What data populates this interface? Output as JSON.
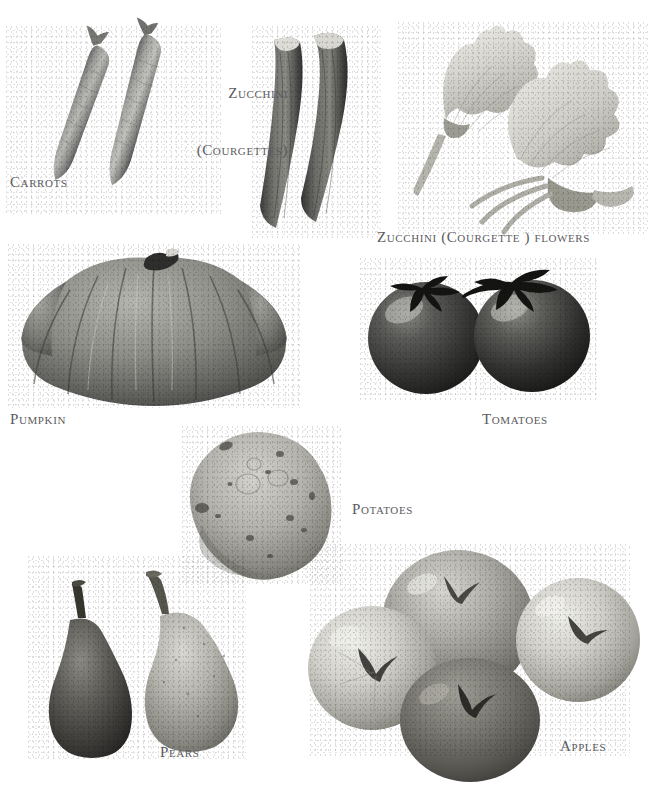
{
  "page": {
    "background_color": "#ffffff",
    "caption_color": "#5b5b60",
    "style": "black-and-white photographic plate of vegetables and fruits with small-caps serif captions"
  },
  "captions": {
    "carrots": "Carrots",
    "zucchini_line1": "Zucchini",
    "zucchini_line2": "(Courgettes)",
    "zucchini_flowers": "Zucchini (Courgette ) flowers",
    "pumpkin": "Pumpkin",
    "tomatoes": "Tomatoes",
    "potatoes": "Potatoes",
    "pears": "Pears",
    "apples": "Apples"
  },
  "specimens": [
    {
      "name": "carrots",
      "label": "Carrots",
      "count": 2,
      "tone": "mid-gray",
      "arrangement": "two tapering roots laid diagonally, stem ends upper-left"
    },
    {
      "name": "zucchini",
      "label": "Zucchini (Courgettes)",
      "count": 2,
      "tone": "dark-gray",
      "arrangement": "two curved courgettes side by side, pale cut ends at top"
    },
    {
      "name": "zucchini-flowers",
      "label": "Zucchini (Courgette ) flowers",
      "count": 2,
      "tone": "very-light-gray",
      "arrangement": "two open blossoms with radiating petals and slender stems"
    },
    {
      "name": "pumpkin",
      "label": "Pumpkin",
      "count": 1,
      "tone": "mid-dark-gray",
      "arrangement": "wide flattened ribbed pumpkin with short stem on top"
    },
    {
      "name": "tomatoes",
      "label": "Tomatoes",
      "count": 2,
      "tone": "very-dark-gray",
      "arrangement": "two round tomatoes joined by a curling stem"
    },
    {
      "name": "potatoes",
      "label": "Potatoes",
      "count": 1,
      "tone": "light-gray",
      "arrangement": "single speckled oval potato"
    },
    {
      "name": "pears",
      "label": "Pears",
      "count": 2,
      "tone": "dark and light",
      "arrangement": "one dark pear left, one pale pear right, both with stalks"
    },
    {
      "name": "apples",
      "label": "Apples",
      "count": 4,
      "tone": "light to dark",
      "arrangement": "four apples clustered, three pale and one dark in front"
    }
  ]
}
